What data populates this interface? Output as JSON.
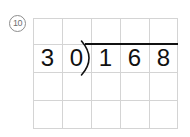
{
  "page": {
    "background_color": "#ffffff",
    "ink_color": "#111111",
    "grid_line_color": "#d4d4d4",
    "marker_color": "#6f6f6f"
  },
  "problem": {
    "number_label": "10",
    "number_marker_icon": "circled-number-icon",
    "type": "long-division",
    "divisor": "30",
    "dividend": "168",
    "expression": "168 ÷ 30",
    "bracket_icon": "division-bracket-icon",
    "vinculum_icon": "division-overbar-icon"
  },
  "grid": {
    "columns": 5,
    "rows": 4,
    "cell_width": 29,
    "cell_height": 27.75
  },
  "digits": {
    "row": [
      {
        "cell": 0,
        "value": "3"
      },
      {
        "cell": 1,
        "value": "0"
      },
      {
        "cell": 2,
        "value": "1"
      },
      {
        "cell": 3,
        "value": "6"
      },
      {
        "cell": 4,
        "value": "8"
      }
    ]
  }
}
